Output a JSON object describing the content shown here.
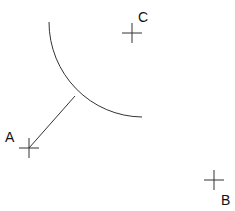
{
  "diagram": {
    "points": [
      {
        "id": "A",
        "label": "A"
      },
      {
        "id": "B",
        "label": "B"
      },
      {
        "id": "C",
        "label": "C"
      }
    ],
    "elements": [
      {
        "type": "arc",
        "description": "quarter-circle arc"
      },
      {
        "type": "segment",
        "description": "line from point A to the arc"
      }
    ],
    "colors": {
      "stroke": "#333333",
      "text": "#111111",
      "background": "#ffffff"
    }
  }
}
